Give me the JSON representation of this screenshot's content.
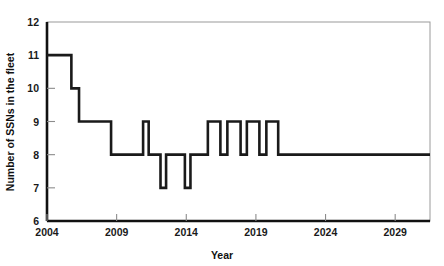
{
  "chart_data": {
    "type": "line",
    "line_style": "step",
    "title": "",
    "subtitle": "",
    "xlabel": "Year",
    "ylabel": "Number of SSNs in the fleet",
    "xlim": [
      2004,
      2031.5
    ],
    "ylim": [
      6,
      12
    ],
    "xticks": [
      2004,
      2009,
      2014,
      2019,
      2024,
      2029
    ],
    "xtick_labels": [
      "2004",
      "2009",
      "2014",
      "2019",
      "2024",
      "2029"
    ],
    "yticks": [
      6,
      7,
      8,
      9,
      10,
      11,
      12
    ],
    "ytick_labels": [
      "6",
      "7",
      "8",
      "9",
      "10",
      "11",
      "12"
    ],
    "grid": false,
    "legend": null,
    "legend_position": "none",
    "series": [
      {
        "name": "SSNs in the fleet",
        "color": "#1a1a1a",
        "line_width": 2.6,
        "x": [
          2004.0,
          2005.75,
          2005.75,
          2006.3,
          2006.3,
          2008.6,
          2008.6,
          2010.9,
          2010.9,
          2011.3,
          2011.3,
          2012.15,
          2012.15,
          2012.55,
          2012.55,
          2013.9,
          2013.9,
          2014.3,
          2014.3,
          2015.55,
          2015.55,
          2016.45,
          2016.45,
          2016.95,
          2016.95,
          2017.9,
          2017.9,
          2018.35,
          2018.35,
          2019.25,
          2019.25,
          2019.75,
          2019.75,
          2020.6,
          2020.6,
          2021.5,
          2021.5,
          2031.5
        ],
        "y": [
          11,
          11,
          10,
          10,
          9,
          9,
          8,
          8,
          9,
          9,
          8,
          8,
          7,
          7,
          8,
          8,
          7,
          7,
          8,
          8,
          9,
          9,
          8,
          8,
          9,
          9,
          8,
          8,
          9,
          9,
          8,
          8,
          9,
          9,
          8,
          8,
          8,
          8
        ]
      }
    ],
    "annotations": [],
    "description_points": [
      {
        "year_range": "2004-2005.75",
        "value": 11
      },
      {
        "year_range": "2005.75-2006.3",
        "value": 10
      },
      {
        "year_range": "2006.3-2008.6",
        "value": 9
      },
      {
        "year_range": "2008.6-2010.9",
        "value": 8
      },
      {
        "year_range": "2010.9-2011.3",
        "value": 9
      },
      {
        "year_range": "2011.3-2012.15",
        "value": 8
      },
      {
        "year_range": "2012.15-2012.55",
        "value": 7
      },
      {
        "year_range": "2012.55-2013.9",
        "value": 8
      },
      {
        "year_range": "2013.9-2014.3",
        "value": 7
      },
      {
        "year_range": "2014.3-2015.55",
        "value": 8
      },
      {
        "year_range": "2015.55-2016.45",
        "value": 9
      },
      {
        "year_range": "2016.45-2016.95",
        "value": 8
      },
      {
        "year_range": "2016.95-2017.9",
        "value": 9
      },
      {
        "year_range": "2017.9-2018.35",
        "value": 8
      },
      {
        "year_range": "2018.35-2019.25",
        "value": 9
      },
      {
        "year_range": "2019.25-2019.75",
        "value": 8
      },
      {
        "year_range": "2019.75-2020.6",
        "value": 9
      },
      {
        "year_range": "2020.6-2031.5",
        "value": 8
      }
    ]
  },
  "style": {
    "line_color": "#1a1a1a",
    "axis_color": "#111111",
    "frame_color": "#9a9a9a",
    "tick_color": "#8c8c8c",
    "background": "#ffffff"
  }
}
